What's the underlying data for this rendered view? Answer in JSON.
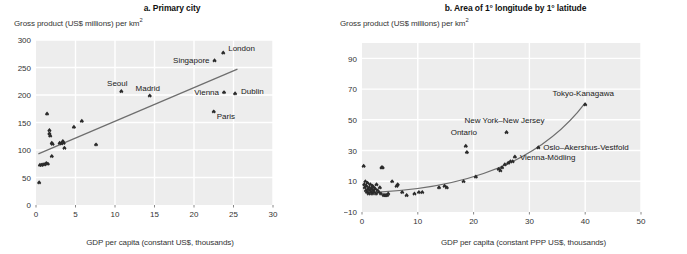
{
  "figure": {
    "panels": [
      {
        "id": "a",
        "title": "a. Primary city",
        "y_axis_title_main": "Gross product (US$ millions) per km",
        "y_axis_title_sup": "2",
        "x_axis_title": "GDP per capita (constant US$, thousands)",
        "y_ticks": [
          "0",
          "50",
          "100",
          "150",
          "200",
          "250",
          "300"
        ],
        "x_ticks": [
          "0",
          "5",
          "10",
          "15",
          "20",
          "25",
          "30"
        ]
      },
      {
        "id": "b",
        "title": "b. Area of 1° longitude by 1° latitude",
        "y_axis_title_main": "Gross product (US$ millions) per km",
        "y_axis_title_sup": "2",
        "x_axis_title": "GDP per capita (constant PPP US$, thousands)",
        "y_ticks": [
          "−10",
          "10",
          "30",
          "50",
          "70",
          "90"
        ],
        "x_ticks": [
          "0",
          "10",
          "20",
          "30",
          "40",
          "50"
        ]
      }
    ]
  },
  "colors": {
    "plot_background": "#ededed",
    "gridline": "#ffffff",
    "marker": "#2b2b2b",
    "trendline": "#6e6e6e",
    "text": "#1a1a1a",
    "axis_text": "#333333"
  },
  "chart_data": [
    {
      "type": "scatter",
      "panel": "a",
      "title": "a. Primary city",
      "xlabel": "GDP per capita (constant US$, thousands)",
      "ylabel": "Gross product (US$ millions) per km2",
      "xlim": [
        0,
        30
      ],
      "ylim": [
        0,
        300
      ],
      "xticks": [
        0,
        5,
        10,
        15,
        20,
        25,
        30
      ],
      "yticks": [
        0,
        50,
        100,
        150,
        200,
        250,
        300
      ],
      "grid": true,
      "legend": "none",
      "points": [
        {
          "x": 0.4,
          "y": 41,
          "label": ""
        },
        {
          "x": 0.5,
          "y": 73,
          "label": ""
        },
        {
          "x": 0.7,
          "y": 73,
          "label": ""
        },
        {
          "x": 0.9,
          "y": 74,
          "label": ""
        },
        {
          "x": 1.1,
          "y": 74,
          "label": ""
        },
        {
          "x": 1.3,
          "y": 76,
          "label": ""
        },
        {
          "x": 1.5,
          "y": 75,
          "label": ""
        },
        {
          "x": 1.7,
          "y": 130,
          "label": ""
        },
        {
          "x": 1.7,
          "y": 136,
          "label": ""
        },
        {
          "x": 1.8,
          "y": 126,
          "label": ""
        },
        {
          "x": 1.4,
          "y": 166,
          "label": ""
        },
        {
          "x": 2.0,
          "y": 89,
          "label": ""
        },
        {
          "x": 2.0,
          "y": 113,
          "label": ""
        },
        {
          "x": 2.1,
          "y": 111,
          "label": ""
        },
        {
          "x": 3.0,
          "y": 113,
          "label": ""
        },
        {
          "x": 3.2,
          "y": 112,
          "label": ""
        },
        {
          "x": 3.4,
          "y": 116,
          "label": ""
        },
        {
          "x": 3.5,
          "y": 113,
          "label": ""
        },
        {
          "x": 3.6,
          "y": 104,
          "label": ""
        },
        {
          "x": 4.8,
          "y": 142,
          "label": ""
        },
        {
          "x": 5.8,
          "y": 153,
          "label": ""
        },
        {
          "x": 7.6,
          "y": 110,
          "label": ""
        },
        {
          "x": 10.8,
          "y": 207,
          "label": "Seoul"
        },
        {
          "x": 14.4,
          "y": 199,
          "label": "Madrid"
        },
        {
          "x": 22.6,
          "y": 263,
          "label": "Singapore"
        },
        {
          "x": 23.7,
          "y": 277,
          "label": "London"
        },
        {
          "x": 22.5,
          "y": 170,
          "label": "Paris"
        },
        {
          "x": 23.8,
          "y": 205,
          "label": "Vienna"
        },
        {
          "x": 25.2,
          "y": 203,
          "label": "Dublin"
        }
      ],
      "trendline": {
        "type": "linear",
        "x0": 0.3,
        "y0": 93,
        "x1": 25.5,
        "y1": 247
      }
    },
    {
      "type": "scatter",
      "panel": "b",
      "title": "b. Area of 1° longitude by 1° latitude",
      "xlabel": "GDP per capita (constant PPP US$, thousands)",
      "ylabel": "Gross product (US$ millions) per km2",
      "xlim": [
        0,
        50
      ],
      "ylim": [
        -10,
        100
      ],
      "xticks": [
        0,
        10,
        20,
        30,
        40,
        50
      ],
      "yticks": [
        -10,
        10,
        30,
        50,
        70,
        90
      ],
      "grid": true,
      "legend": "none",
      "points": [
        {
          "x": 0.3,
          "y": 20,
          "label": ""
        },
        {
          "x": 0.4,
          "y": 8,
          "label": ""
        },
        {
          "x": 0.5,
          "y": 6,
          "label": ""
        },
        {
          "x": 0.6,
          "y": 10,
          "label": ""
        },
        {
          "x": 0.7,
          "y": 4,
          "label": ""
        },
        {
          "x": 0.8,
          "y": 7,
          "label": ""
        },
        {
          "x": 0.9,
          "y": 3,
          "label": ""
        },
        {
          "x": 1.0,
          "y": 9,
          "label": ""
        },
        {
          "x": 1.1,
          "y": 5,
          "label": ""
        },
        {
          "x": 1.2,
          "y": 2,
          "label": ""
        },
        {
          "x": 1.3,
          "y": 6,
          "label": ""
        },
        {
          "x": 1.4,
          "y": 4,
          "label": ""
        },
        {
          "x": 1.5,
          "y": 8,
          "label": ""
        },
        {
          "x": 1.6,
          "y": 3,
          "label": ""
        },
        {
          "x": 1.7,
          "y": 5,
          "label": ""
        },
        {
          "x": 1.8,
          "y": 2,
          "label": ""
        },
        {
          "x": 1.9,
          "y": 7,
          "label": ""
        },
        {
          "x": 2.0,
          "y": 4,
          "label": ""
        },
        {
          "x": 2.1,
          "y": 6,
          "label": ""
        },
        {
          "x": 2.2,
          "y": 3,
          "label": ""
        },
        {
          "x": 2.4,
          "y": 5,
          "label": ""
        },
        {
          "x": 2.5,
          "y": 2,
          "label": ""
        },
        {
          "x": 2.6,
          "y": 8,
          "label": ""
        },
        {
          "x": 2.8,
          "y": 4,
          "label": ""
        },
        {
          "x": 3.0,
          "y": 3,
          "label": ""
        },
        {
          "x": 3.2,
          "y": 6,
          "label": ""
        },
        {
          "x": 3.4,
          "y": 2,
          "label": ""
        },
        {
          "x": 3.5,
          "y": 19,
          "label": ""
        },
        {
          "x": 3.7,
          "y": 19,
          "label": ""
        },
        {
          "x": 3.9,
          "y": 1,
          "label": ""
        },
        {
          "x": 4.1,
          "y": 1,
          "label": ""
        },
        {
          "x": 4.3,
          "y": 1,
          "label": ""
        },
        {
          "x": 4.5,
          "y": 1,
          "label": ""
        },
        {
          "x": 4.7,
          "y": 2,
          "label": ""
        },
        {
          "x": 5.4,
          "y": 10,
          "label": ""
        },
        {
          "x": 6.2,
          "y": 7,
          "label": ""
        },
        {
          "x": 6.4,
          "y": 8,
          "label": ""
        },
        {
          "x": 7.2,
          "y": 3,
          "label": ""
        },
        {
          "x": 8.0,
          "y": 1,
          "label": ""
        },
        {
          "x": 9.4,
          "y": 2,
          "label": ""
        },
        {
          "x": 10.2,
          "y": 3,
          "label": ""
        },
        {
          "x": 10.8,
          "y": 3,
          "label": ""
        },
        {
          "x": 13.8,
          "y": 6,
          "label": ""
        },
        {
          "x": 14.8,
          "y": 7,
          "label": ""
        },
        {
          "x": 15.2,
          "y": 6,
          "label": ""
        },
        {
          "x": 18.2,
          "y": 10,
          "label": ""
        },
        {
          "x": 18.6,
          "y": 33,
          "label": "Ontario"
        },
        {
          "x": 18.8,
          "y": 29,
          "label": ""
        },
        {
          "x": 20.4,
          "y": 13,
          "label": ""
        },
        {
          "x": 24.5,
          "y": 18,
          "label": ""
        },
        {
          "x": 24.8,
          "y": 17,
          "label": ""
        },
        {
          "x": 25.1,
          "y": 19,
          "label": ""
        },
        {
          "x": 25.6,
          "y": 21,
          "label": ""
        },
        {
          "x": 25.9,
          "y": 42,
          "label": "New York–New Jersey"
        },
        {
          "x": 26.2,
          "y": 22,
          "label": ""
        },
        {
          "x": 26.6,
          "y": 23,
          "label": ""
        },
        {
          "x": 27.0,
          "y": 23,
          "label": ""
        },
        {
          "x": 27.4,
          "y": 26,
          "label": "Vienna-Mödling"
        },
        {
          "x": 31.6,
          "y": 32,
          "label": "Oslo–Akershus-Vestfold"
        },
        {
          "x": 40.0,
          "y": 60,
          "label": "Tokyo-Kanagawa"
        }
      ],
      "trendline": {
        "type": "quadratic",
        "x0": 3.0,
        "y0": 3,
        "x1": 40.0,
        "y1": 61
      }
    }
  ]
}
